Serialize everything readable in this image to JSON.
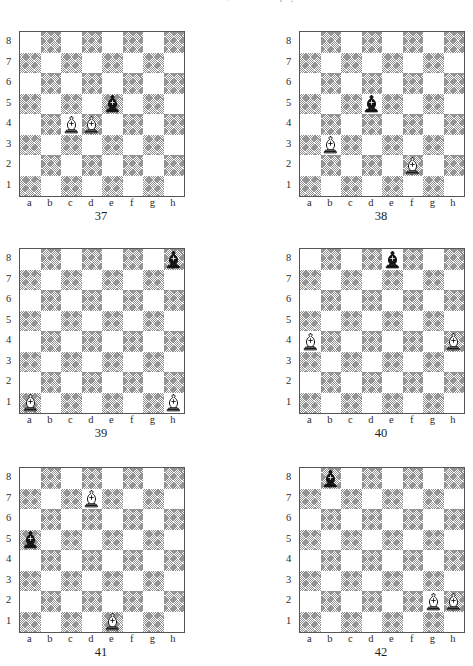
{
  "page": {
    "header_text": "and to move and draw; and White to play and win",
    "colors": {
      "light_square": "#ffffff",
      "dark_square_ink": "#8e8e8e",
      "board_border": "#555555",
      "text": "#1a1a1a",
      "white_piece_fill": "#ffffff",
      "black_piece_fill": "#151515"
    }
  },
  "labels": {
    "ranks": [
      "8",
      "7",
      "6",
      "5",
      "4",
      "3",
      "2",
      "1"
    ],
    "files": [
      "a",
      "b",
      "c",
      "d",
      "e",
      "f",
      "g",
      "h"
    ]
  },
  "diagrams": [
    {
      "caption": "37",
      "position": "col-l row-1",
      "pieces": [
        {
          "piece": "white-bishop",
          "color": "white",
          "type": "bishop",
          "file": "c",
          "rank": "4"
        },
        {
          "piece": "white-bishop",
          "color": "white",
          "type": "bishop",
          "file": "d",
          "rank": "4"
        },
        {
          "piece": "black-bishop",
          "color": "black",
          "type": "bishop",
          "file": "e",
          "rank": "5"
        }
      ]
    },
    {
      "caption": "38",
      "position": "col-r row-1",
      "pieces": [
        {
          "piece": "black-bishop",
          "color": "black",
          "type": "bishop",
          "file": "d",
          "rank": "5"
        },
        {
          "piece": "white-bishop",
          "color": "white",
          "type": "bishop",
          "file": "b",
          "rank": "3"
        },
        {
          "piece": "white-bishop",
          "color": "white",
          "type": "bishop",
          "file": "f",
          "rank": "2"
        }
      ]
    },
    {
      "caption": "39",
      "position": "col-l row-2",
      "pieces": [
        {
          "piece": "black-bishop",
          "color": "black",
          "type": "bishop",
          "file": "h",
          "rank": "8"
        },
        {
          "piece": "white-bishop",
          "color": "white",
          "type": "bishop",
          "file": "a",
          "rank": "1"
        },
        {
          "piece": "white-bishop",
          "color": "white",
          "type": "bishop",
          "file": "h",
          "rank": "1"
        }
      ]
    },
    {
      "caption": "40",
      "position": "col-r row-2",
      "pieces": [
        {
          "piece": "black-bishop",
          "color": "black",
          "type": "bishop",
          "file": "e",
          "rank": "8"
        },
        {
          "piece": "white-bishop",
          "color": "white",
          "type": "bishop",
          "file": "a",
          "rank": "4"
        },
        {
          "piece": "white-bishop",
          "color": "white",
          "type": "bishop",
          "file": "h",
          "rank": "4"
        }
      ]
    },
    {
      "caption": "41",
      "position": "col-l row-3",
      "pieces": [
        {
          "piece": "white-bishop",
          "color": "white",
          "type": "bishop",
          "file": "d",
          "rank": "7"
        },
        {
          "piece": "black-bishop",
          "color": "black",
          "type": "bishop",
          "file": "a",
          "rank": "5"
        },
        {
          "piece": "white-bishop",
          "color": "white",
          "type": "bishop",
          "file": "e",
          "rank": "1"
        }
      ]
    },
    {
      "caption": "42",
      "position": "col-r row-3",
      "pieces": [
        {
          "piece": "black-bishop",
          "color": "black",
          "type": "bishop",
          "file": "b",
          "rank": "8"
        },
        {
          "piece": "white-bishop",
          "color": "white",
          "type": "bishop",
          "file": "g",
          "rank": "2"
        },
        {
          "piece": "white-bishop",
          "color": "white",
          "type": "bishop",
          "file": "h",
          "rank": "2"
        }
      ]
    }
  ]
}
